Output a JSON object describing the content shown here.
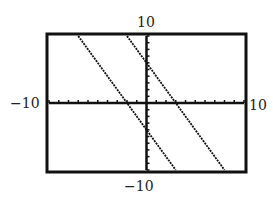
{
  "chart_data": {
    "type": "line",
    "title": "",
    "xlabel": "",
    "ylabel": "",
    "xlim": [
      -10,
      10
    ],
    "ylim": [
      -10,
      10
    ],
    "grid": false,
    "tick_spacing": 1,
    "tick_labels": {
      "x_min": "−10",
      "x_max": "10",
      "y_min": "−10",
      "y_max": "10"
    },
    "series": [
      {
        "name": "line-1",
        "equation": "y = -2x + 6",
        "slope": -2,
        "intercept": 6,
        "x": [
          -2,
          8
        ],
        "y": [
          10,
          -10
        ]
      },
      {
        "name": "line-2",
        "equation": "y = -2x - 4",
        "slope": -2,
        "intercept": -4,
        "x": [
          -7,
          3
        ],
        "y": [
          10,
          -10
        ]
      }
    ],
    "style": "graphing-calculator window, dotted pixel lines"
  }
}
